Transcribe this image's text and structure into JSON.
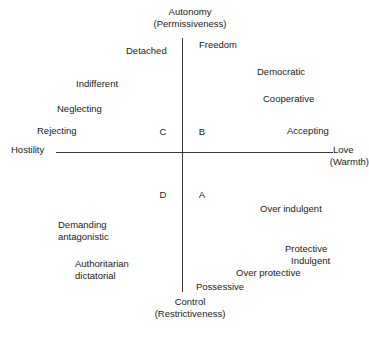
{
  "figure": {
    "type": "quadrant-diagram",
    "background_color": "#ffffff",
    "axis_color": "#3a3a3a",
    "text_color": "#1a1a1a"
  },
  "axes": {
    "vertical": {
      "top_label": "Autonomy",
      "top_sublabel": "(Permissiveness)",
      "bottom_label": "Control",
      "bottom_sublabel": "(Restrictiveness)"
    },
    "horizontal": {
      "left_label": "Hostility",
      "right_label": "Love",
      "right_sublabel": "(Warmth)"
    }
  },
  "quadrants": [
    {
      "letter": "B",
      "position": "top-right"
    },
    {
      "letter": "C",
      "position": "top-left"
    },
    {
      "letter": "A",
      "position": "bottom-right"
    },
    {
      "letter": "D",
      "position": "bottom-left"
    }
  ],
  "traits": {
    "top_left": [
      {
        "text": "Detached"
      },
      {
        "text": "Indifferent"
      },
      {
        "text": "Neglecting"
      },
      {
        "text": "Rejecting"
      }
    ],
    "top_right": [
      {
        "text": "Freedom"
      },
      {
        "text": "Democratic"
      },
      {
        "text": "Cooperative"
      },
      {
        "text": "Accepting"
      }
    ],
    "bottom_right": [
      {
        "text": "Over indulgent"
      },
      {
        "text": "Protective"
      },
      {
        "text": "Indulgent"
      },
      {
        "text": "Over protective"
      },
      {
        "text": "Possessive"
      }
    ],
    "bottom_left": [
      {
        "text": "Demanding"
      },
      {
        "text": "antagonistic"
      },
      {
        "text": "Authoritarian"
      },
      {
        "text": "dictatorial"
      }
    ]
  }
}
